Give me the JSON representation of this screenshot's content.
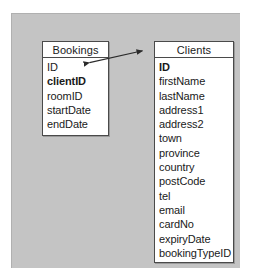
{
  "diagram": {
    "background_color": "#c4c4c4",
    "page_color": "#ffffff",
    "entity_border_color": "#4a4a4a",
    "text_color": "#1a1a1a"
  },
  "entities": [
    {
      "id": "bookings",
      "name": "Bookings",
      "attributes": [
        {
          "name": "ID",
          "key": false
        },
        {
          "name": "clientID",
          "key": true
        },
        {
          "name": "roomID",
          "key": false
        },
        {
          "name": "startDate",
          "key": false
        },
        {
          "name": "endDate",
          "key": false
        }
      ]
    },
    {
      "id": "clients",
      "name": "Clients",
      "attributes": [
        {
          "name": "ID",
          "key": true
        },
        {
          "name": "firstName",
          "key": false
        },
        {
          "name": "lastName",
          "key": false
        },
        {
          "name": "address1",
          "key": false
        },
        {
          "name": "address2",
          "key": false
        },
        {
          "name": "town",
          "key": false
        },
        {
          "name": "province",
          "key": false
        },
        {
          "name": "country",
          "key": false
        },
        {
          "name": "postCode",
          "key": false
        },
        {
          "name": "tel",
          "key": false
        },
        {
          "name": "email",
          "key": false
        },
        {
          "name": "cardNo",
          "key": false
        },
        {
          "name": "expiryDate",
          "key": false
        },
        {
          "name": "bookingTypeID",
          "key": false
        }
      ]
    }
  ],
  "relationships": [
    {
      "id": "bookings-clients",
      "from_entity": "Bookings",
      "from_attribute": "clientID",
      "to_entity": "Clients",
      "to_attribute": "ID",
      "line_color": "#2b2b2b",
      "arrow_style": "double-headed"
    }
  ]
}
